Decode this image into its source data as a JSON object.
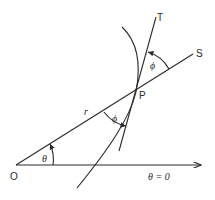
{
  "diagram": {
    "points": {
      "origin": "O",
      "point_on_curve": "P",
      "tangent_end": "T",
      "radius_extension_end": "S"
    },
    "labels": {
      "radius": "r",
      "polar_angle": "θ",
      "tangent_angle_lower": "ϕ",
      "tangent_angle_upper": "ϕ",
      "initial_line": "θ = 0"
    }
  }
}
